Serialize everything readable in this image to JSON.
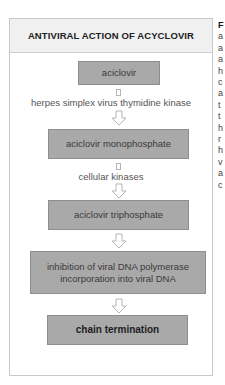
{
  "figure": {
    "title": "ANTIVIRAL ACTION OF ACYCLOVIR",
    "steps": [
      {
        "label": "aciclovir",
        "emphasis": false
      },
      {
        "label": "aciclovir monophosphate",
        "emphasis": false
      },
      {
        "label": "aciclovir triphosphate",
        "emphasis": false
      },
      {
        "label_line1": "inhibition of viral DNA polymerase",
        "label_line2": "incorporation into viral DNA",
        "emphasis": false
      },
      {
        "label": "chain termination",
        "emphasis": true
      }
    ],
    "enzymes": [
      "herpes simplex virus thymidine kinase",
      "cellular kinases"
    ],
    "colors": {
      "box_fill": "#a9a9a9",
      "header_fill": "#f0f0f0",
      "frame_border": "#c8c8c8",
      "arrow_outline": "#b5b5b5"
    }
  },
  "side_text": {
    "fragments": [
      "F",
      "a",
      "a",
      "a",
      "h",
      "c",
      "a",
      "t",
      "t",
      "h",
      "r",
      "h",
      "v",
      "a",
      "c"
    ]
  }
}
